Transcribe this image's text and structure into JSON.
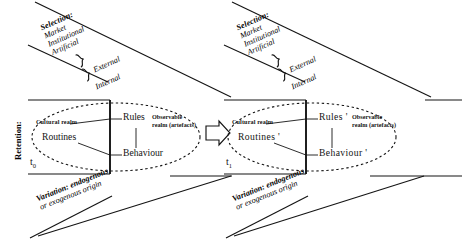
{
  "diagram": {
    "type": "process-diagram",
    "colors": {
      "stroke": "#141414",
      "text": "#141414",
      "background": "#ffffff"
    },
    "axis_labels": {
      "retention": "Retention:"
    },
    "selection": {
      "title": "Selection:",
      "items": [
        "Market",
        "Institutional",
        "Artificial"
      ],
      "groups": [
        {
          "label": "External",
          "members": [
            "Market",
            "Institutional"
          ]
        },
        {
          "label": "Internal",
          "members": [
            "Artificial"
          ]
        }
      ]
    },
    "variation": {
      "line1": "Variation: endogenous",
      "line2": "or exogenous origin",
      "emphasis": "Variation:"
    },
    "clusters": [
      {
        "id": "t0",
        "time_label": "t",
        "time_subscript": "0",
        "cultural_realm_label": "Cultural realm",
        "observable_realm_label_line1": "Observable",
        "observable_realm_label_line2": "realm (artefacts)",
        "routines": "Routines",
        "rules": "Rules",
        "behaviour": "Behaviour"
      },
      {
        "id": "t1",
        "time_label": "t",
        "time_subscript": "1",
        "cultural_realm_label": "Cultural realm",
        "observable_realm_label_line1": "Observable",
        "observable_realm_label_line2": "realm (artefacts)",
        "routines": "Routines '",
        "rules": "Rules '",
        "behaviour": "Behaviour '"
      }
    ],
    "transition_arrow": {
      "name": "evolution-arrow",
      "direction": "right"
    }
  }
}
